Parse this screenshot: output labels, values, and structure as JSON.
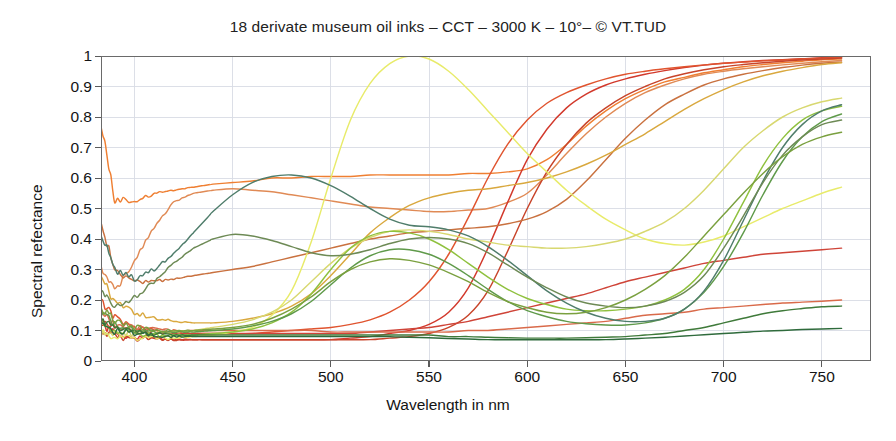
{
  "chart_data": {
    "type": "line",
    "title": "18 derivate museum oil inks – CCT – 3000 K – 10°– © VT.TUD",
    "xlabel": "Wavelength in nm",
    "ylabel": "Spectral refectance",
    "xlim": [
      383,
      775
    ],
    "ylim": [
      0,
      1
    ],
    "xticks": [
      400,
      450,
      500,
      550,
      600,
      650,
      700,
      750
    ],
    "yticks": [
      "0",
      "0.1",
      "0.2",
      "0.3",
      "0.4",
      "0.5",
      "0.6",
      "0.7",
      "0.8",
      "0.9",
      "1"
    ],
    "ytick_values": [
      0,
      0.1,
      0.2,
      0.3,
      0.4,
      0.5,
      0.6,
      0.7,
      0.8,
      0.9,
      1
    ],
    "grid": true,
    "legend": "none",
    "series_count": 18,
    "x": [
      383,
      390,
      400,
      410,
      420,
      430,
      440,
      450,
      460,
      470,
      480,
      490,
      500,
      510,
      520,
      530,
      540,
      550,
      560,
      570,
      580,
      590,
      600,
      610,
      620,
      630,
      640,
      650,
      660,
      670,
      680,
      690,
      700,
      710,
      720,
      730,
      740,
      750,
      760
    ],
    "series": [
      {
        "name": "ink-01-orange-bright",
        "color": "#ef7f32",
        "values": [
          0.78,
          0.53,
          0.52,
          0.55,
          0.56,
          0.57,
          0.58,
          0.585,
          0.59,
          0.6,
          0.6,
          0.605,
          0.605,
          0.605,
          0.61,
          0.61,
          0.61,
          0.61,
          0.61,
          0.615,
          0.615,
          0.62,
          0.63,
          0.66,
          0.71,
          0.77,
          0.82,
          0.86,
          0.89,
          0.915,
          0.93,
          0.945,
          0.955,
          0.965,
          0.972,
          0.978,
          0.983,
          0.988,
          0.99
        ]
      },
      {
        "name": "ink-02-salmon",
        "color": "#e08a55",
        "values": [
          0.3,
          0.23,
          0.33,
          0.44,
          0.52,
          0.55,
          0.56,
          0.565,
          0.56,
          0.555,
          0.545,
          0.535,
          0.525,
          0.515,
          0.505,
          0.5,
          0.495,
          0.49,
          0.49,
          0.495,
          0.5,
          0.52,
          0.55,
          0.61,
          0.68,
          0.745,
          0.8,
          0.845,
          0.88,
          0.905,
          0.925,
          0.94,
          0.95,
          0.958,
          0.965,
          0.971,
          0.976,
          0.981,
          0.985
        ]
      },
      {
        "name": "ink-03-red-deep",
        "color": "#d2392c",
        "values": [
          0.12,
          0.09,
          0.08,
          0.075,
          0.07,
          0.07,
          0.07,
          0.07,
          0.07,
          0.07,
          0.07,
          0.07,
          0.07,
          0.075,
          0.08,
          0.09,
          0.1,
          0.12,
          0.16,
          0.24,
          0.37,
          0.52,
          0.66,
          0.76,
          0.83,
          0.875,
          0.905,
          0.925,
          0.94,
          0.952,
          0.962,
          0.97,
          0.976,
          0.981,
          0.985,
          0.988,
          0.991,
          0.994,
          0.996
        ]
      },
      {
        "name": "ink-04-scarlet",
        "color": "#e0542f",
        "values": [
          0.2,
          0.14,
          0.11,
          0.1,
          0.095,
          0.09,
          0.09,
          0.09,
          0.09,
          0.095,
          0.1,
          0.105,
          0.11,
          0.12,
          0.135,
          0.16,
          0.2,
          0.26,
          0.35,
          0.47,
          0.6,
          0.71,
          0.79,
          0.845,
          0.88,
          0.905,
          0.925,
          0.94,
          0.95,
          0.958,
          0.965,
          0.971,
          0.976,
          0.98,
          0.984,
          0.987,
          0.99,
          0.993,
          0.995
        ]
      },
      {
        "name": "ink-05-vermilion",
        "color": "#c8442a",
        "values": [
          0.1,
          0.08,
          0.075,
          0.07,
          0.07,
          0.07,
          0.07,
          0.07,
          0.07,
          0.07,
          0.07,
          0.07,
          0.07,
          0.07,
          0.07,
          0.075,
          0.08,
          0.09,
          0.11,
          0.15,
          0.23,
          0.36,
          0.5,
          0.62,
          0.71,
          0.78,
          0.83,
          0.87,
          0.9,
          0.925,
          0.942,
          0.955,
          0.965,
          0.972,
          0.978,
          0.983,
          0.987,
          0.99,
          0.993
        ]
      },
      {
        "name": "ink-06-crimson-flat",
        "color": "#cf4438",
        "values": [
          0.14,
          0.11,
          0.1,
          0.095,
          0.09,
          0.09,
          0.09,
          0.09,
          0.09,
          0.09,
          0.09,
          0.09,
          0.09,
          0.09,
          0.095,
          0.1,
          0.105,
          0.11,
          0.12,
          0.13,
          0.145,
          0.16,
          0.175,
          0.19,
          0.205,
          0.22,
          0.24,
          0.26,
          0.275,
          0.29,
          0.305,
          0.32,
          0.33,
          0.34,
          0.35,
          0.355,
          0.36,
          0.365,
          0.37
        ]
      },
      {
        "name": "ink-07-brick-low",
        "color": "#d96a4a",
        "values": [
          0.16,
          0.12,
          0.11,
          0.105,
          0.1,
          0.1,
          0.1,
          0.1,
          0.1,
          0.1,
          0.1,
          0.1,
          0.095,
          0.095,
          0.095,
          0.095,
          0.095,
          0.095,
          0.095,
          0.1,
          0.1,
          0.105,
          0.11,
          0.115,
          0.12,
          0.125,
          0.13,
          0.14,
          0.15,
          0.155,
          0.16,
          0.17,
          0.175,
          0.18,
          0.185,
          0.19,
          0.193,
          0.196,
          0.2
        ]
      },
      {
        "name": "ink-08-terracotta",
        "color": "#c9713f",
        "values": [
          0.45,
          0.3,
          0.26,
          0.26,
          0.27,
          0.28,
          0.29,
          0.3,
          0.31,
          0.325,
          0.34,
          0.355,
          0.37,
          0.385,
          0.4,
          0.41,
          0.42,
          0.425,
          0.43,
          0.435,
          0.44,
          0.45,
          0.465,
          0.49,
          0.53,
          0.59,
          0.66,
          0.73,
          0.79,
          0.84,
          0.875,
          0.905,
          0.925,
          0.94,
          0.952,
          0.962,
          0.97,
          0.976,
          0.98
        ]
      },
      {
        "name": "ink-09-ochre-gold",
        "color": "#d9a83e",
        "values": [
          0.28,
          0.19,
          0.16,
          0.14,
          0.13,
          0.125,
          0.125,
          0.13,
          0.14,
          0.155,
          0.18,
          0.22,
          0.28,
          0.35,
          0.42,
          0.47,
          0.51,
          0.535,
          0.55,
          0.56,
          0.565,
          0.575,
          0.585,
          0.6,
          0.62,
          0.645,
          0.675,
          0.71,
          0.745,
          0.785,
          0.825,
          0.86,
          0.89,
          0.915,
          0.935,
          0.95,
          0.962,
          0.972,
          0.978
        ]
      },
      {
        "name": "ink-10-yellow-peak",
        "color": "#e8eb6a",
        "values": [
          0.09,
          0.08,
          0.075,
          0.075,
          0.075,
          0.08,
          0.085,
          0.095,
          0.11,
          0.15,
          0.23,
          0.39,
          0.6,
          0.79,
          0.91,
          0.975,
          1.0,
          0.99,
          0.95,
          0.89,
          0.82,
          0.75,
          0.68,
          0.62,
          0.56,
          0.51,
          0.465,
          0.43,
          0.4,
          0.385,
          0.38,
          0.39,
          0.41,
          0.44,
          0.47,
          0.5,
          0.525,
          0.55,
          0.57
        ]
      },
      {
        "name": "ink-11-pale-yellow",
        "color": "#d8d870",
        "values": [
          0.1,
          0.09,
          0.09,
          0.09,
          0.095,
          0.1,
          0.11,
          0.12,
          0.135,
          0.16,
          0.2,
          0.26,
          0.32,
          0.37,
          0.405,
          0.425,
          0.43,
          0.425,
          0.415,
          0.4,
          0.39,
          0.38,
          0.375,
          0.37,
          0.37,
          0.375,
          0.385,
          0.4,
          0.425,
          0.455,
          0.5,
          0.56,
          0.63,
          0.7,
          0.755,
          0.8,
          0.83,
          0.85,
          0.862
        ]
      },
      {
        "name": "ink-12-lime-green",
        "color": "#8fc13e",
        "values": [
          0.13,
          0.1,
          0.09,
          0.085,
          0.085,
          0.085,
          0.09,
          0.095,
          0.105,
          0.125,
          0.16,
          0.22,
          0.3,
          0.37,
          0.41,
          0.425,
          0.42,
          0.4,
          0.365,
          0.32,
          0.275,
          0.235,
          0.205,
          0.185,
          0.17,
          0.165,
          0.165,
          0.17,
          0.18,
          0.2,
          0.235,
          0.3,
          0.4,
          0.52,
          0.64,
          0.73,
          0.79,
          0.82,
          0.835
        ]
      },
      {
        "name": "ink-13-grass-green",
        "color": "#5f9a4a",
        "values": [
          0.16,
          0.12,
          0.1,
          0.095,
          0.095,
          0.095,
          0.1,
          0.105,
          0.115,
          0.13,
          0.155,
          0.195,
          0.25,
          0.305,
          0.345,
          0.365,
          0.365,
          0.35,
          0.32,
          0.28,
          0.235,
          0.195,
          0.165,
          0.145,
          0.13,
          0.122,
          0.118,
          0.118,
          0.125,
          0.14,
          0.17,
          0.225,
          0.31,
          0.42,
          0.545,
          0.655,
          0.735,
          0.785,
          0.81
        ]
      },
      {
        "name": "ink-14-teal-broad",
        "color": "#4f7d6b",
        "values": [
          0.42,
          0.3,
          0.27,
          0.3,
          0.35,
          0.42,
          0.49,
          0.545,
          0.585,
          0.605,
          0.61,
          0.6,
          0.575,
          0.54,
          0.5,
          0.465,
          0.445,
          0.44,
          0.43,
          0.41,
          0.375,
          0.33,
          0.28,
          0.23,
          0.19,
          0.16,
          0.14,
          0.13,
          0.13,
          0.14,
          0.17,
          0.23,
          0.33,
          0.46,
          0.59,
          0.7,
          0.775,
          0.82,
          0.84
        ]
      },
      {
        "name": "ink-15-olive-green",
        "color": "#6d8a55",
        "values": [
          0.23,
          0.18,
          0.21,
          0.26,
          0.32,
          0.37,
          0.4,
          0.415,
          0.41,
          0.395,
          0.375,
          0.355,
          0.345,
          0.35,
          0.365,
          0.385,
          0.4,
          0.405,
          0.4,
          0.385,
          0.355,
          0.315,
          0.275,
          0.24,
          0.21,
          0.19,
          0.18,
          0.175,
          0.18,
          0.195,
          0.225,
          0.28,
          0.37,
          0.475,
          0.585,
          0.675,
          0.735,
          0.775,
          0.79
        ]
      },
      {
        "name": "ink-16-dark-green-low",
        "color": "#3f7a3a",
        "values": [
          0.14,
          0.11,
          0.095,
          0.09,
          0.085,
          0.085,
          0.085,
          0.085,
          0.085,
          0.085,
          0.085,
          0.085,
          0.085,
          0.085,
          0.085,
          0.085,
          0.085,
          0.085,
          0.08,
          0.08,
          0.078,
          0.076,
          0.075,
          0.075,
          0.075,
          0.076,
          0.078,
          0.08,
          0.085,
          0.09,
          0.1,
          0.11,
          0.125,
          0.14,
          0.155,
          0.165,
          0.172,
          0.178,
          0.18
        ]
      },
      {
        "name": "ink-17-forest-dark",
        "color": "#2f6b3c",
        "values": [
          0.12,
          0.1,
          0.09,
          0.085,
          0.08,
          0.08,
          0.08,
          0.08,
          0.08,
          0.08,
          0.08,
          0.08,
          0.08,
          0.08,
          0.08,
          0.08,
          0.078,
          0.076,
          0.074,
          0.072,
          0.07,
          0.07,
          0.07,
          0.07,
          0.07,
          0.07,
          0.07,
          0.072,
          0.075,
          0.078,
          0.082,
          0.086,
          0.09,
          0.094,
          0.098,
          0.1,
          0.103,
          0.105,
          0.107
        ]
      },
      {
        "name": "ink-18-green-mid-hump",
        "color": "#7aa03f",
        "values": [
          0.18,
          0.13,
          0.11,
          0.1,
          0.1,
          0.1,
          0.105,
          0.11,
          0.12,
          0.14,
          0.17,
          0.21,
          0.26,
          0.3,
          0.325,
          0.335,
          0.33,
          0.315,
          0.29,
          0.26,
          0.225,
          0.195,
          0.175,
          0.16,
          0.155,
          0.16,
          0.175,
          0.2,
          0.235,
          0.28,
          0.34,
          0.41,
          0.48,
          0.55,
          0.615,
          0.67,
          0.71,
          0.735,
          0.75
        ]
      }
    ]
  },
  "axes": {
    "x_tick_labels": [
      "400",
      "450",
      "500",
      "550",
      "600",
      "650",
      "700",
      "750"
    ],
    "y_tick_labels": [
      "1",
      "0.9",
      "0.8",
      "0.7",
      "0.6",
      "0.5",
      "0.4",
      "0.3",
      "0.2",
      "0.1",
      "0"
    ]
  }
}
